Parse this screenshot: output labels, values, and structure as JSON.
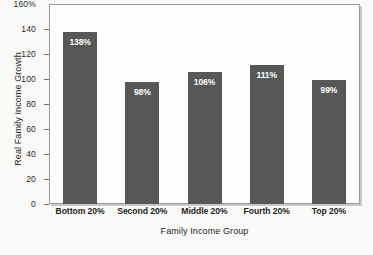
{
  "chart_data": {
    "type": "bar",
    "title": "",
    "xlabel": "Family Income Group",
    "ylabel": "Real Family Income Growth",
    "categories": [
      "Bottom 20%",
      "Second 20%",
      "Middle 20%",
      "Fourth 20%",
      "Top 20%"
    ],
    "values": [
      138,
      98,
      106,
      111,
      99
    ],
    "data_labels": [
      "138%",
      "98%",
      "106%",
      "111%",
      "99%"
    ],
    "ylim": [
      0,
      160
    ],
    "y_ticks": [
      0,
      20,
      40,
      60,
      80,
      100,
      120,
      140,
      160
    ],
    "y_tick_labels": [
      "0",
      "20",
      "40",
      "60",
      "80",
      "100",
      "120",
      "140",
      "160%"
    ],
    "grid": false,
    "legend": false,
    "bar_color": "#575757",
    "plot_background": "#fdfdfc",
    "label_text_color": "#ffffff"
  },
  "axes": {
    "y_title": "Real Family Income Growth",
    "x_title": "Family Income Group"
  }
}
